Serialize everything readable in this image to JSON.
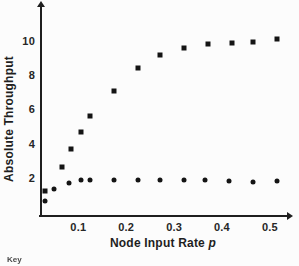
{
  "figure": {
    "background_color": "#fcfcfc",
    "ink_color": "#1f1f1f",
    "key_caption": "Key"
  },
  "chart_data": {
    "type": "scatter",
    "title": "",
    "xlabel": "Node Input Rate p",
    "xlabel_text": "Node Input Rate",
    "xlabel_variable": "p",
    "ylabel": "Absolute Throughput",
    "xlim": [
      0.02,
      0.55
    ],
    "ylim": [
      0,
      12
    ],
    "grid": false,
    "legend_position": "none",
    "x_ticks": [
      0.1,
      0.2,
      0.3,
      0.4,
      0.5
    ],
    "x_tick_labels": [
      "0.1",
      "0.2",
      "0.3",
      "0.4",
      "0.5"
    ],
    "y_ticks": [
      2,
      4,
      6,
      8,
      10
    ],
    "y_tick_labels": [
      "2",
      "4",
      "6",
      "8",
      "10"
    ],
    "series": [
      {
        "name": "saturating-series",
        "marker": "filled-square",
        "color": "#141414",
        "points": [
          [
            0.03,
            1.2
          ],
          [
            0.065,
            2.65
          ],
          [
            0.085,
            3.7
          ],
          [
            0.105,
            4.7
          ],
          [
            0.125,
            5.6
          ],
          [
            0.175,
            7.1
          ],
          [
            0.225,
            8.4
          ],
          [
            0.27,
            9.2
          ],
          [
            0.32,
            9.6
          ],
          [
            0.37,
            9.8
          ],
          [
            0.42,
            9.9
          ],
          [
            0.465,
            9.95
          ],
          [
            0.515,
            10.1
          ]
        ]
      },
      {
        "name": "flat-series",
        "marker": "filled-circle",
        "color": "#141414",
        "points": [
          [
            0.03,
            0.65
          ],
          [
            0.05,
            1.35
          ],
          [
            0.08,
            1.7
          ],
          [
            0.105,
            1.85
          ],
          [
            0.125,
            1.9
          ],
          [
            0.175,
            1.9
          ],
          [
            0.225,
            1.9
          ],
          [
            0.27,
            1.85
          ],
          [
            0.32,
            1.85
          ],
          [
            0.365,
            1.9
          ],
          [
            0.415,
            1.8
          ],
          [
            0.465,
            1.75
          ],
          [
            0.515,
            1.8
          ]
        ]
      }
    ]
  }
}
